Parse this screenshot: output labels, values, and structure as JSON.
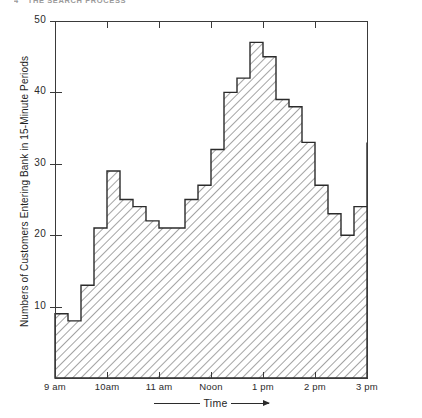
{
  "header": {
    "folio": "4",
    "running_title": "THE SEARCH PROCESS"
  },
  "axes": {
    "y_title": "Numbers of Customers Entering Bank in 15-Minute Periods",
    "x_title": "Time",
    "y_ticks": [
      10,
      20,
      30,
      40,
      50
    ],
    "y_tick_labels": [
      "10",
      "20",
      "30",
      "40",
      "50"
    ],
    "x_tick_labels": [
      "9 am",
      "10am",
      "11 am",
      "Noon",
      "1 pm",
      "2 pm",
      "3 pm"
    ]
  },
  "chart_data": {
    "type": "bar",
    "title": "",
    "xlabel": "Time",
    "ylabel": "Numbers of Customers Entering Bank in 15-Minute Periods",
    "ylim": [
      0,
      50
    ],
    "xlim": [
      "9 am",
      "3 pm"
    ],
    "grid": false,
    "legend": "none",
    "bin_minutes": 15,
    "categories": [
      "9:00",
      "9:15",
      "9:30",
      "9:45",
      "10:00",
      "10:15",
      "10:30",
      "10:45",
      "11:00",
      "11:15",
      "11:30",
      "11:45",
      "12:00",
      "12:15",
      "12:30",
      "12:45",
      "1:00",
      "1:15",
      "1:30",
      "1:45",
      "2:00",
      "2:15",
      "2:30",
      "2:45"
    ],
    "values": [
      9,
      8,
      13,
      21,
      29,
      25,
      24,
      22,
      21,
      21,
      25,
      27,
      32,
      40,
      42,
      47,
      45,
      39,
      38,
      33,
      27,
      23,
      20,
      24
    ],
    "final_edge_value": 33,
    "tick_positions_hours": [
      "9 am",
      "10am",
      "11 am",
      "Noon",
      "1 pm",
      "2 pm",
      "3 pm"
    ]
  },
  "style": {
    "line_color": "#2b2b2b",
    "hatch_color": "#4a4a4a",
    "background": "#ffffff"
  }
}
